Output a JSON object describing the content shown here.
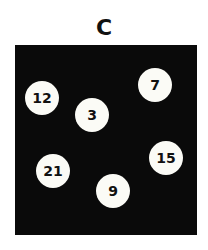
{
  "title": "C",
  "balls": [
    {
      "label": "12",
      "x": 42,
      "y": 98
    },
    {
      "label": "3",
      "x": 92,
      "y": 115
    },
    {
      "label": "7",
      "x": 155,
      "y": 85
    },
    {
      "label": "21",
      "x": 53,
      "y": 171
    },
    {
      "label": "15",
      "x": 166,
      "y": 158
    },
    {
      "label": "9",
      "x": 113,
      "y": 191
    }
  ],
  "colors": {
    "panel": "#0a0a0a",
    "ball": "#fbfbf6",
    "text": "#111111"
  }
}
